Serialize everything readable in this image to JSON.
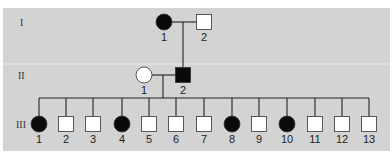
{
  "colors": {
    "background": "#d3d3d3",
    "band_divider": "#ececec",
    "line": "#222222",
    "affected": "#0a0a0a",
    "unaffected": "#ffffff",
    "stroke": "#333333"
  },
  "generations": [
    {
      "label": "I",
      "individuals": [
        {
          "id": "1",
          "sex": "female",
          "affected": true
        },
        {
          "id": "2",
          "sex": "male",
          "affected": false
        }
      ]
    },
    {
      "label": "II",
      "individuals": [
        {
          "id": "1",
          "sex": "female",
          "affected": false
        },
        {
          "id": "2",
          "sex": "male",
          "affected": true
        }
      ]
    },
    {
      "label": "III",
      "individuals": [
        {
          "id": "1",
          "sex": "female",
          "affected": true
        },
        {
          "id": "2",
          "sex": "male",
          "affected": false
        },
        {
          "id": "3",
          "sex": "male",
          "affected": false
        },
        {
          "id": "4",
          "sex": "female",
          "affected": true
        },
        {
          "id": "5",
          "sex": "male",
          "affected": false
        },
        {
          "id": "6",
          "sex": "male",
          "affected": false
        },
        {
          "id": "7",
          "sex": "male",
          "affected": false
        },
        {
          "id": "8",
          "sex": "female",
          "affected": true
        },
        {
          "id": "9",
          "sex": "male",
          "affected": false
        },
        {
          "id": "10",
          "sex": "female",
          "affected": true
        },
        {
          "id": "11",
          "sex": "male",
          "affected": false
        },
        {
          "id": "12",
          "sex": "male",
          "affected": false
        },
        {
          "id": "13",
          "sex": "male",
          "affected": false
        }
      ]
    }
  ]
}
